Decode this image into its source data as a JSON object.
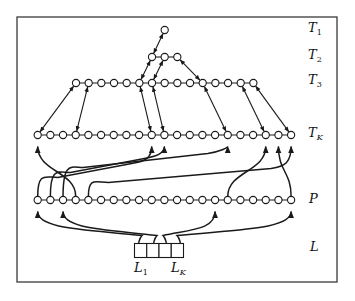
{
  "diagram": {
    "colors": {
      "stroke": "#1a1a1a",
      "node_fill": "#ffffff",
      "frame": "#3a3a3a"
    },
    "frame": {
      "x": 17,
      "y": 17,
      "width": 320,
      "height": 265
    },
    "row_labels": [
      {
        "id": "T1",
        "main": "T",
        "sub": "1",
        "y": 32
      },
      {
        "id": "T2",
        "main": "T",
        "sub": "2",
        "y": 59
      },
      {
        "id": "T3",
        "main": "T",
        "sub": "3",
        "y": 84
      },
      {
        "id": "TK",
        "main": "T",
        "sub": "K",
        "y": 137
      },
      {
        "id": "P",
        "main": "P",
        "sub": "",
        "y": 203
      },
      {
        "id": "L",
        "main": "L",
        "sub": "",
        "y": 251
      }
    ],
    "rows": {
      "T1": {
        "y": 30,
        "x_start": 164.7,
        "count": 1,
        "spacing": 12.67
      },
      "T2": {
        "y": 57,
        "x_start": 152,
        "count": 3,
        "spacing": 12.67
      },
      "T3": {
        "y": 83,
        "x_start": 76,
        "count": 15,
        "spacing": 12.67
      },
      "TK": {
        "y": 135,
        "x_start": 37.7,
        "count": 21,
        "spacing": 12.67
      },
      "P": {
        "y": 200,
        "x_start": 37.7,
        "count": 21,
        "spacing": 12.67
      }
    },
    "tree_links": [
      {
        "from": [
          "T2",
          0
        ],
        "to": [
          "T1",
          0
        ]
      },
      {
        "from": [
          "T3",
          5
        ],
        "to": [
          "T2",
          0
        ]
      },
      {
        "from": [
          "T3",
          6
        ],
        "to": [
          "T2",
          1
        ]
      },
      {
        "from": [
          "T2",
          2
        ],
        "to": [
          "T3",
          10
        ]
      },
      {
        "from": [
          "TK",
          0
        ],
        "to": [
          "T3",
          0
        ]
      },
      {
        "from": [
          "TK",
          3
        ],
        "to": [
          "T3",
          1
        ]
      },
      {
        "from": [
          "T3",
          5
        ],
        "to": [
          "TK",
          9
        ]
      },
      {
        "from": [
          "T3",
          6
        ],
        "to": [
          "TK",
          10
        ]
      },
      {
        "from": [
          "T3",
          10
        ],
        "to": [
          "TK",
          15
        ]
      },
      {
        "from": [
          "T3",
          13
        ],
        "to": [
          "TK",
          18
        ]
      },
      {
        "from": [
          "T3",
          14
        ],
        "to": [
          "TK",
          20
        ]
      }
    ],
    "p_to_tk_curves": [
      {
        "p": 3,
        "tk": 0
      },
      {
        "p": 0,
        "tk": 9
      },
      {
        "p": 1,
        "tk": 10
      },
      {
        "p": 2,
        "tk": 15
      },
      {
        "p": 4,
        "tk": 20
      },
      {
        "p": 15,
        "tk": 18
      },
      {
        "p": 20,
        "tk": 19
      }
    ],
    "l_box": {
      "x": 134.5,
      "y": 243.5,
      "cells": 4,
      "cell_width": 12.25,
      "height": 14
    },
    "l_to_p_curves": [
      {
        "cell": 0,
        "start_x": 138,
        "p": 0
      },
      {
        "cell": 1,
        "start_x": 153,
        "p": 2
      },
      {
        "cell": 2,
        "start_x": 167,
        "p": 14
      },
      {
        "cell": 3,
        "start_x": 181,
        "p": 20
      }
    ],
    "bottom_labels": [
      {
        "id": "L1",
        "main": "L",
        "sub": "1",
        "x": 134,
        "y": 272
      },
      {
        "id": "LK",
        "main": "L",
        "sub": "K",
        "x": 171,
        "y": 272
      }
    ]
  }
}
